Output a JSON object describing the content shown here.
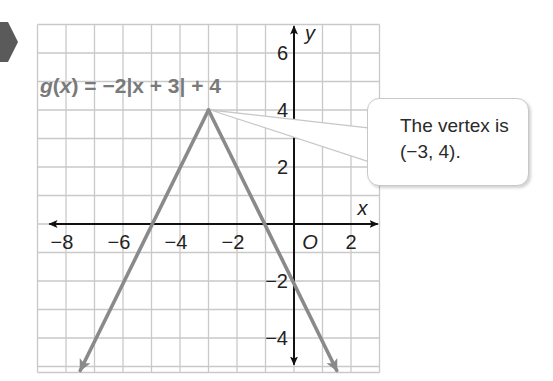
{
  "marker": {
    "shape": "hexagon",
    "color": "#5a5a5a"
  },
  "function_label": {
    "prefix": "g",
    "var": "x",
    "equation_rhs": "= −2|x + 3| + 4",
    "full": "g(x) = −2|x + 3| + 4"
  },
  "callout": {
    "line1": "The vertex is",
    "line2": "(−3, 4)."
  },
  "colors": {
    "grid": "#c9c9c9",
    "axis": "#111111",
    "graph": "#8a8a8a",
    "label": "#7a7a7a",
    "marker": "#5a5a5a"
  },
  "axes": {
    "x_label": "x",
    "y_label": "y",
    "origin_label": "O",
    "x_ticks": [
      {
        "value": -8,
        "label": "−8"
      },
      {
        "value": -6,
        "label": "−6"
      },
      {
        "value": -4,
        "label": "−4"
      },
      {
        "value": -2,
        "label": "−2"
      },
      {
        "value": 2,
        "label": "2"
      }
    ],
    "y_ticks": [
      {
        "value": 6,
        "label": "6"
      },
      {
        "value": 4,
        "label": "4"
      },
      {
        "value": 2,
        "label": "2"
      },
      {
        "value": -2,
        "label": "−2"
      },
      {
        "value": -4,
        "label": "−4"
      }
    ]
  },
  "chart_data": {
    "type": "line",
    "title": "g(x) = −2|x + 3| + 4",
    "xlabel": "x",
    "ylabel": "y",
    "xlim": [
      -9,
      3
    ],
    "ylim": [
      -5,
      7
    ],
    "grid": true,
    "legend": null,
    "series": [
      {
        "name": "g(x) = −2|x + 3| + 4",
        "x": [
          -7.5,
          -5,
          -3,
          -1,
          1.5
        ],
        "y": [
          -5,
          0,
          4,
          0,
          -5
        ],
        "arrows_at_ends": true
      }
    ],
    "annotations": [
      {
        "text": "The vertex is (−3, 4).",
        "point": [
          -3,
          4
        ]
      }
    ],
    "vertex": [
      -3,
      4
    ],
    "x_intercepts": [
      -5,
      -1
    ],
    "y_intercept": -2
  }
}
